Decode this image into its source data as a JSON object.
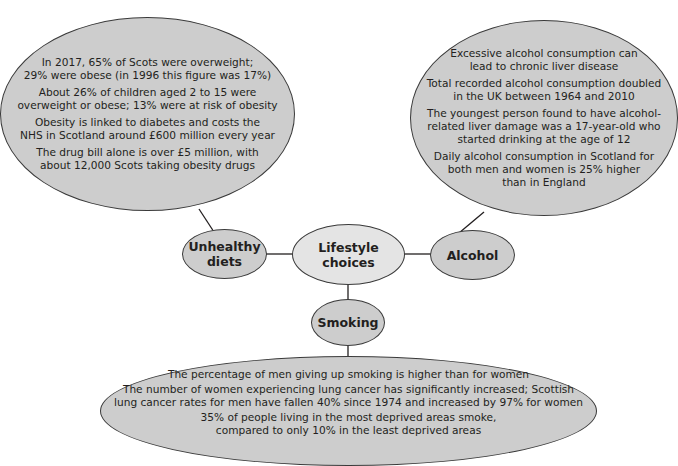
{
  "diagram": {
    "center": {
      "label": "Lifestyle choices"
    },
    "branches": [
      {
        "id": "diets",
        "label": "Unhealthy\ndiets",
        "facts": [
          "In 2017, 65% of Scots were overweight;\n29% were obese (in 1996 this figure was 17%)",
          "About 26% of children aged 2 to 15 were\noverweight or obese; 13% were at risk of obesity",
          "Obesity is linked to diabetes and costs the\nNHS in Scotland around £600 million every year",
          "The drug bill alone is over £5 million, with\nabout 12,000 Scots taking obesity drugs"
        ]
      },
      {
        "id": "alcohol",
        "label": "Alcohol",
        "facts": [
          "Excessive alcohol consumption can\nlead to chronic liver disease",
          "Total recorded alcohol consumption doubled\nin the UK between 1964 and 2010",
          "The youngest person found to have alcohol-\nrelated liver damage was a 17-year-old who\nstarted drinking at the age of 12",
          "Daily alcohol consumption in Scotland for\nboth men and women is 25% higher\nthan in England"
        ]
      },
      {
        "id": "smoking",
        "label": "Smoking",
        "facts": [
          "The percentage of men giving up smoking is higher than for women",
          "The number of women experiencing lung cancer has significantly increased; Scottish\nlung cancer rates for men have fallen 40% since 1974 and increased by 97% for women",
          "35% of people living in the most deprived areas smoke,\ncompared to only 10% in the least deprived areas"
        ]
      }
    ],
    "colors": {
      "node_fill": "#cdcdcd",
      "center_fill": "#e4e4e4",
      "stroke": "#3a3a3a",
      "text": "#231f20"
    }
  }
}
